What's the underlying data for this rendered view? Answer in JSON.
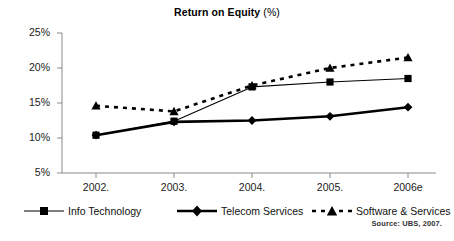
{
  "chart_data": {
    "type": "line",
    "title": "Return on Equity (%)",
    "title_main": "Return on Equity",
    "title_unit": "(%)",
    "xlabel": "",
    "ylabel": "",
    "categories": [
      "2002.",
      "2003.",
      "2004.",
      "2005.",
      "2006e"
    ],
    "x": [
      2002,
      2003,
      2004,
      2005,
      2006
    ],
    "ylim": [
      5,
      25
    ],
    "ytick_labels": [
      "25%",
      "20%",
      "15%",
      "10%",
      "5%"
    ],
    "ytick_values": [
      25,
      20,
      15,
      10,
      5
    ],
    "grid": false,
    "legend_position": "bottom",
    "series": [
      {
        "name": "Info Technology",
        "marker": "square",
        "line_style": "solid",
        "line_width": "thin",
        "color": "#000000",
        "values": [
          10.4,
          12.4,
          17.3,
          18.0,
          18.5
        ]
      },
      {
        "name": "Telecom Services",
        "marker": "diamond",
        "line_style": "solid",
        "line_width": "thick",
        "color": "#000000",
        "values": [
          10.4,
          12.3,
          12.5,
          13.1,
          14.4
        ]
      },
      {
        "name": "Software & Services",
        "marker": "triangle",
        "line_style": "dashed",
        "line_width": "thick",
        "color": "#000000",
        "values": [
          14.6,
          13.8,
          17.5,
          20.0,
          21.5
        ]
      }
    ],
    "source_note": "Source: UBS, 2007."
  },
  "legend": {
    "items": [
      {
        "label": "Info Technology"
      },
      {
        "label": "Telecom Services"
      },
      {
        "label": "Software & Services"
      }
    ]
  },
  "footer": {
    "source": "Source: UBS, 2007."
  },
  "colors": {
    "axis": "#8a8a8a",
    "series": "#000000",
    "text": "#111111",
    "background": "#ffffff"
  }
}
